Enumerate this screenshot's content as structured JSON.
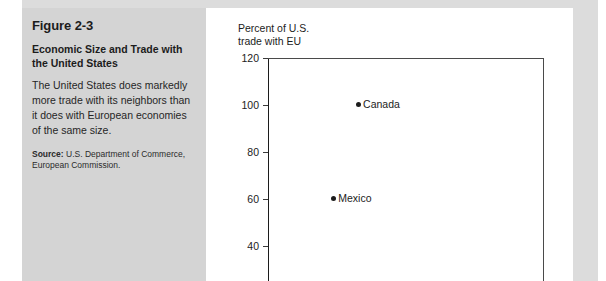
{
  "caption": {
    "figure_number": "Figure 2-3",
    "title": "Economic Size and Trade with the United States",
    "body": "The United States does markedly more trade with its neighbors than it does with European economies of the same size.",
    "source_label": "Source:",
    "source_text": " U.S. Department of Commerce, European Commission."
  },
  "colors": {
    "panel_gray": "#d4d4d4",
    "band_gray": "#dcdcdc",
    "ink": "#1c1c1c",
    "axis": "#4a4a4a"
  },
  "chart_data": {
    "type": "scatter",
    "title": "",
    "ylabel": "Percent of U.S.\ntrade with EU",
    "xlabel": "",
    "ylim": [
      40,
      120
    ],
    "yticks": [
      120,
      100,
      80,
      60,
      40
    ],
    "ytick_labels": [
      "120",
      "100",
      "80",
      "60",
      "40"
    ],
    "grid": false,
    "legend": "none",
    "note": "Vertical axis truncated at 40 by the screenshot crop; horizontal axis not visible.",
    "points": [
      {
        "label": "Canada",
        "y": 100,
        "x_pixel_frac": 0.33
      },
      {
        "label": "Mexico",
        "y": 60,
        "x_pixel_frac": 0.24
      }
    ]
  }
}
